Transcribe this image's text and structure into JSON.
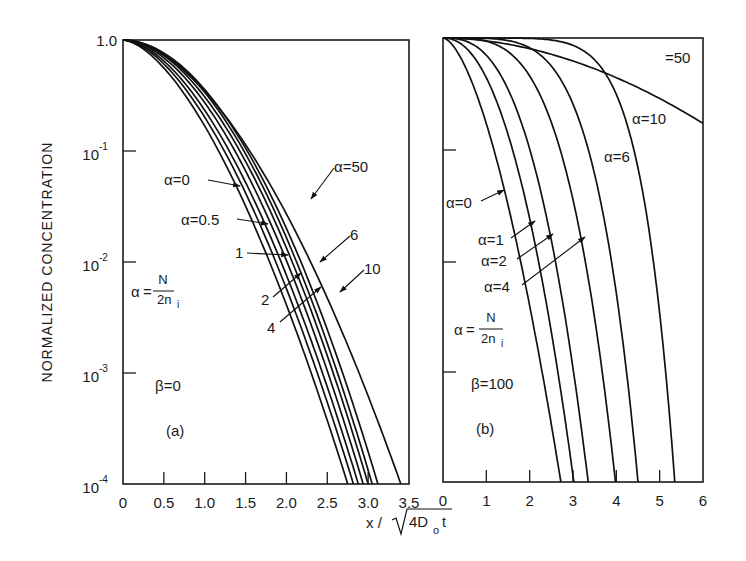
{
  "figure": {
    "y_axis_label": "NORMALIZED CONCENTRATION",
    "x_axis_label_prefix": "x /",
    "x_axis_label_radicand": "4D",
    "x_axis_label_sub": "o",
    "x_axis_label_suffix": "t",
    "y_ticks": [
      {
        "base": "1.0",
        "exp": ""
      },
      {
        "base": "10",
        "exp": "-1"
      },
      {
        "base": "10",
        "exp": "-2"
      },
      {
        "base": "10",
        "exp": "-3"
      },
      {
        "base": "10",
        "exp": "-4"
      }
    ]
  },
  "chart_data": [
    {
      "type": "line",
      "panel": "(a)",
      "title": "(a)",
      "xlabel": "x/√(4D₀t)",
      "ylabel": "NORMALIZED CONCENTRATION",
      "yscale": "log",
      "ylim": [
        0.0001,
        1.0
      ],
      "xlim": [
        0,
        3.5
      ],
      "x_ticks": [
        "0",
        "0.5",
        "1.0",
        "1.5",
        "2.0",
        "2.5",
        "3.0",
        "3.5"
      ],
      "y_ticks": [
        "1.0",
        "10^-1",
        "10^-2",
        "10^-3",
        "10^-4"
      ],
      "grid": false,
      "annotations": [
        "α = N / 2n_i",
        "β = 0"
      ],
      "series": [
        {
          "name": "α=0",
          "label": "α=0",
          "x_at_1e-4": 2.75,
          "x_at_1e-1": 1.17,
          "x_at_1e-2": 1.82
        },
        {
          "name": "α=0.5",
          "label": "α=0.5",
          "x_at_1e-4": 2.82,
          "x_at_1e-1": 1.24,
          "x_at_1e-2": 1.88
        },
        {
          "name": "α=1",
          "label": "1",
          "x_at_1e-4": 2.88,
          "x_at_1e-1": 1.3,
          "x_at_1e-2": 1.95
        },
        {
          "name": "α=2",
          "label": "2",
          "x_at_1e-4": 2.94,
          "x_at_1e-1": 1.37,
          "x_at_1e-2": 2.01
        },
        {
          "name": "α=4",
          "label": "4",
          "x_at_1e-4": 3.0,
          "x_at_1e-1": 1.43,
          "x_at_1e-2": 2.07
        },
        {
          "name": "α=6",
          "label": "6",
          "x_at_1e-4": 3.05,
          "x_at_1e-1": 1.48,
          "x_at_1e-2": 2.12
        },
        {
          "name": "α=10",
          "label": "10",
          "x_at_1e-4": 3.12,
          "x_at_1e-1": 1.52,
          "x_at_1e-2": 2.19
        },
        {
          "name": "α=50",
          "label": "α=50",
          "x_at_1e-4": 3.4,
          "x_at_1e-1": 1.55,
          "x_at_1e-2": 2.4
        }
      ]
    },
    {
      "type": "line",
      "panel": "(b)",
      "title": "(b)",
      "xlabel": "x/√(4D₀t)",
      "ylabel": "NORMALIZED CONCENTRATION",
      "yscale": "log",
      "ylim": [
        0.0001,
        1.0
      ],
      "xlim": [
        0,
        6
      ],
      "x_ticks": [
        "0",
        "1",
        "2",
        "3",
        "4",
        "5",
        "6"
      ],
      "y_ticks": [
        "1.0",
        "10^-1",
        "10^-2",
        "10^-3",
        "10^-4"
      ],
      "grid": false,
      "annotations": [
        "α = N / 2n_i",
        "β = 100"
      ],
      "series": [
        {
          "name": "α=0",
          "label": "α=0",
          "x_at_1e-4": 2.72,
          "x_at_1e-1": 1.17
        },
        {
          "name": "α=1",
          "label": "α=1",
          "x_at_1e-4": 3.02,
          "x_at_1e-1": 1.6
        },
        {
          "name": "α=2",
          "label": "α=2",
          "x_at_1e-4": 3.35,
          "x_at_1e-1": 2.0
        },
        {
          "name": "α=4",
          "label": "α=4",
          "x_at_1e-4": 3.98,
          "x_at_1e-1": 2.7
        },
        {
          "name": "α=6",
          "label": "α=6",
          "x_at_1e-4": 4.5,
          "x_at_1e-1": 3.35
        },
        {
          "name": "α=10",
          "label": "α=10",
          "x_at_1e-4": 5.35,
          "x_at_1e-1": 4.4
        },
        {
          "name": "α=50",
          "label": "=50",
          "y_at_x6": 0.17,
          "y_at_x3": 0.62
        }
      ]
    }
  ],
  "panel_a": {
    "tag": "(a)",
    "beta": "β=0",
    "alpha_def_lhs": "α",
    "alpha_def_num": "N",
    "alpha_def_den": "2n",
    "alpha_def_sub": "i",
    "x_ticks": [
      "0",
      "0.5",
      "1.0",
      "1.5",
      "2.0",
      "2.5",
      "3.0",
      "3.5"
    ],
    "labels": {
      "a0": "α=0",
      "a05": "α=0.5",
      "a1": "1",
      "a2": "2",
      "a4": "4",
      "a6": "6",
      "a10": "10",
      "a50": "α=50"
    }
  },
  "panel_b": {
    "tag": "(b)",
    "beta": "β=100",
    "alpha_def_lhs": "α",
    "alpha_def_num": "N",
    "alpha_def_den": "2n",
    "alpha_def_sub": "i",
    "x_ticks": [
      "0",
      "1",
      "2",
      "3",
      "4",
      "5",
      "6"
    ],
    "labels": {
      "a0": "α=0",
      "a1": "α=1",
      "a2": "α=2",
      "a4": "α=4",
      "a6": "α=6",
      "a10": "α=10",
      "a50": "=50"
    }
  }
}
